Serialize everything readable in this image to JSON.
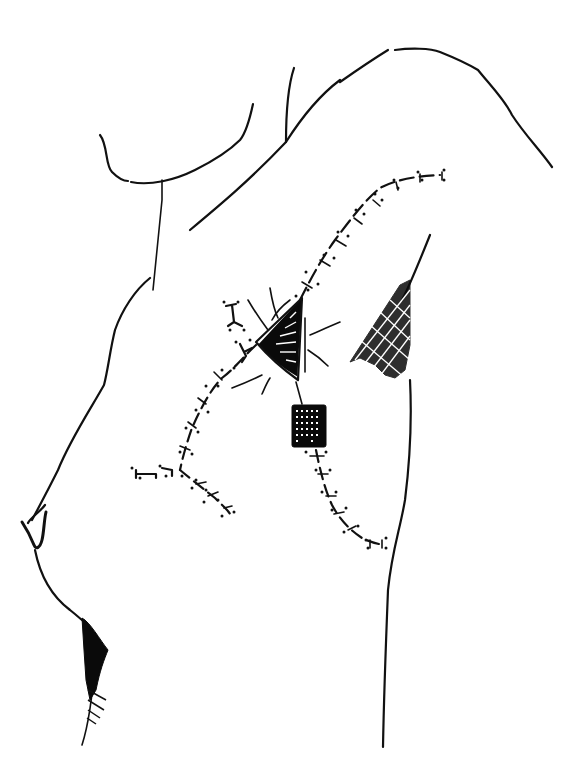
{
  "figure": {
    "type": "medical line illustration",
    "ink_color": "#111111",
    "background": "#ffffff",
    "elements": [
      {
        "name": "body-outline",
        "label": "torso and arm outline"
      },
      {
        "name": "wound-site",
        "label": "triangular open wound with radiating lines"
      },
      {
        "name": "drain-pad",
        "label": "rectangular drain / dressing pad"
      },
      {
        "name": "suture-line-upper",
        "label": "sutured incision toward axilla"
      },
      {
        "name": "suture-line-left",
        "label": "sutured incision toward chest"
      },
      {
        "name": "suture-line-lower",
        "label": "sutured incision below drain"
      },
      {
        "name": "axillary-hair",
        "label": "cross-hatched axillary shading"
      },
      {
        "name": "pubic-shading",
        "label": "cross-hatched lower shading"
      }
    ]
  }
}
